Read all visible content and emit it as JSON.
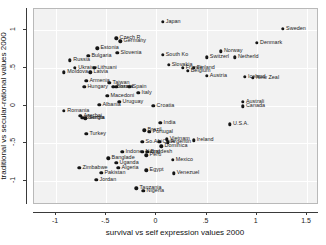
{
  "chart_data": {
    "type": "scatter",
    "title": "",
    "xlabel": "survival vs self expression values 2000",
    "ylabel": "traditional vs secular-rational values 2000",
    "xlim": [
      -1.22,
      1.62
    ],
    "ylim": [
      -1.32,
      1.28
    ],
    "xticks": [
      -1,
      -0.5,
      0,
      0.5,
      1,
      1.5
    ],
    "xtick_labels": [
      "-1",
      "-.5",
      "0",
      ".5",
      "1",
      "1.5"
    ],
    "yticks": [
      1,
      0.5,
      0,
      -0.5,
      -1
    ],
    "ytick_labels": [
      "1",
      ".5",
      "0",
      "-.5",
      "-1"
    ],
    "grid": true,
    "legend": "none",
    "marker_color": "#151515",
    "panel_color": "#f2f2f2",
    "points": [
      {
        "label": "Japan",
        "x": 0.06,
        "y": 1.11,
        "lx": "right"
      },
      {
        "label": "Sweden",
        "x": 1.26,
        "y": 1.02,
        "lx": "right"
      },
      {
        "label": "Czech R.",
        "x": -0.4,
        "y": 0.89,
        "lx": "right"
      },
      {
        "label": "Germany",
        "x": -0.36,
        "y": 0.85,
        "lx": "right"
      },
      {
        "label": "Denmark",
        "x": 1.0,
        "y": 0.83,
        "lx": "right"
      },
      {
        "label": "Estonia",
        "x": -0.59,
        "y": 0.76,
        "lx": "right"
      },
      {
        "label": "Norway",
        "x": 0.64,
        "y": 0.72,
        "lx": "right"
      },
      {
        "label": "Slovenia",
        "x": -0.39,
        "y": 0.7,
        "lx": "right"
      },
      {
        "label": "South Ko",
        "x": 0.06,
        "y": 0.67,
        "lx": "right"
      },
      {
        "label": "Bulgaria",
        "x": -0.68,
        "y": 0.66,
        "lx": "right"
      },
      {
        "label": "Switzerl",
        "x": 0.5,
        "y": 0.64,
        "lx": "right"
      },
      {
        "label": "Netherld",
        "x": 0.78,
        "y": 0.64,
        "lx": "right"
      },
      {
        "label": "Russia",
        "x": -0.86,
        "y": 0.6,
        "lx": "right"
      },
      {
        "label": "Slovakia",
        "x": 0.12,
        "y": 0.54,
        "lx": "right"
      },
      {
        "label": "France",
        "x": 0.26,
        "y": 0.5,
        "lx": "right"
      },
      {
        "label": "Finland",
        "x": 0.37,
        "y": 0.5,
        "lx": "right"
      },
      {
        "label": "Ukraine",
        "x": -0.81,
        "y": 0.5,
        "lx": "right"
      },
      {
        "label": "Lithuani",
        "x": -0.62,
        "y": 0.5,
        "lx": "right"
      },
      {
        "label": "Belgium",
        "x": 0.31,
        "y": 0.46,
        "lx": "right"
      },
      {
        "label": "Moldova",
        "x": -0.92,
        "y": 0.44,
        "lx": "right"
      },
      {
        "label": "Latvia",
        "x": -0.66,
        "y": 0.44,
        "lx": "right"
      },
      {
        "label": "Austria",
        "x": 0.5,
        "y": 0.39,
        "lx": "right"
      },
      {
        "label": "Iceland",
        "x": 0.88,
        "y": 0.38,
        "lx": "right"
      },
      {
        "label": "New Zeal",
        "x": 0.96,
        "y": 0.37,
        "lx": "right"
      },
      {
        "label": "Armenia",
        "x": -0.7,
        "y": 0.33,
        "lx": "right"
      },
      {
        "label": "Taiwan",
        "x": -0.47,
        "y": 0.3,
        "lx": "right"
      },
      {
        "label": "Israel",
        "x": -0.4,
        "y": 0.25,
        "lx": "right"
      },
      {
        "label": "Spain",
        "x": -0.27,
        "y": 0.25,
        "lx": "right"
      },
      {
        "label": "Hungary",
        "x": -0.72,
        "y": 0.25,
        "lx": "right"
      },
      {
        "label": "Bosnia",
        "x": -0.43,
        "y": 0.25,
        "lx": "right"
      },
      {
        "label": "Italy",
        "x": -0.18,
        "y": 0.17,
        "lx": "right"
      },
      {
        "label": "Macedoni",
        "x": -0.49,
        "y": 0.13,
        "lx": "right"
      },
      {
        "label": "Uruguay",
        "x": -0.37,
        "y": 0.05,
        "lx": "right"
      },
      {
        "label": "Australi",
        "x": 0.86,
        "y": 0.05,
        "lx": "right"
      },
      {
        "label": "Canada",
        "x": 0.86,
        "y": -0.01,
        "lx": "right"
      },
      {
        "label": "Albania",
        "x": -0.57,
        "y": 0.01,
        "lx": "right"
      },
      {
        "label": "Croatia",
        "x": -0.03,
        "y": 0.0,
        "lx": "right"
      },
      {
        "label": "Romania",
        "x": -0.92,
        "y": -0.07,
        "lx": "right"
      },
      {
        "label": "Azerbai",
        "x": -0.76,
        "y": -0.14,
        "lx": "right"
      },
      {
        "label": "Georgia",
        "x": -0.74,
        "y": -0.16,
        "lx": "right"
      },
      {
        "label": "Serbia",
        "x": -0.71,
        "y": -0.17,
        "lx": "right"
      },
      {
        "label": "India",
        "x": 0.04,
        "y": -0.23,
        "lx": "right"
      },
      {
        "label": "U.S.A.",
        "x": 0.73,
        "y": -0.25,
        "lx": "right"
      },
      {
        "label": "Brazil",
        "x": -0.12,
        "y": -0.33,
        "lx": "right"
      },
      {
        "label": "Portugal",
        "x": -0.07,
        "y": -0.35,
        "lx": "right"
      },
      {
        "label": "Turkey",
        "x": -0.7,
        "y": -0.38,
        "lx": "right"
      },
      {
        "label": "Vietnam",
        "x": 0.1,
        "y": -0.45,
        "lx": "right"
      },
      {
        "label": "Ireland",
        "x": 0.37,
        "y": -0.46,
        "lx": "right"
      },
      {
        "label": "So.Afri",
        "x": -0.14,
        "y": -0.48,
        "lx": "right"
      },
      {
        "label": "Chile",
        "x": 0.03,
        "y": -0.48,
        "lx": "right"
      },
      {
        "label": "Argentin",
        "x": 0.11,
        "y": -0.49,
        "lx": "right"
      },
      {
        "label": "Dominica",
        "x": 0.05,
        "y": -0.54,
        "lx": "right"
      },
      {
        "label": "Indone",
        "x": -0.34,
        "y": -0.61,
        "lx": "right"
      },
      {
        "label": "Nepal",
        "x": -0.14,
        "y": -0.61,
        "lx": "right"
      },
      {
        "label": "Bngdesh",
        "x": -0.09,
        "y": -0.61,
        "lx": "right"
      },
      {
        "label": "Peru",
        "x": -0.1,
        "y": -0.66,
        "lx": "right"
      },
      {
        "label": "Banglade",
        "x": -0.48,
        "y": -0.7,
        "lx": "right"
      },
      {
        "label": "Mexico",
        "x": 0.16,
        "y": -0.72,
        "lx": "right"
      },
      {
        "label": "Uganda",
        "x": -0.4,
        "y": -0.76,
        "lx": "right"
      },
      {
        "label": "Zimbabwe",
        "x": -0.77,
        "y": -0.83,
        "lx": "right"
      },
      {
        "label": "Algeria",
        "x": -0.38,
        "y": -0.83,
        "lx": "right"
      },
      {
        "label": "Egypt",
        "x": -0.1,
        "y": -0.86,
        "lx": "right"
      },
      {
        "label": "Pakistan",
        "x": -0.55,
        "y": -0.89,
        "lx": "right"
      },
      {
        "label": "Venezuel",
        "x": 0.17,
        "y": -0.9,
        "lx": "right"
      },
      {
        "label": "Jordan",
        "x": -0.6,
        "y": -0.99,
        "lx": "right"
      },
      {
        "label": "Tanzania",
        "x": -0.2,
        "y": -1.1,
        "lx": "right"
      },
      {
        "label": "Nigeria",
        "x": -0.13,
        "y": -1.13,
        "lx": "right"
      }
    ]
  }
}
